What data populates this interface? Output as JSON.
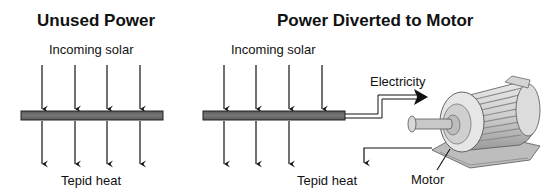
{
  "panels": {
    "left": {
      "title": "Unused Power",
      "incoming_label": "Incoming solar",
      "outgoing_label": "Tepid heat"
    },
    "right": {
      "title": "Power Diverted to Motor",
      "incoming_label": "Incoming solar",
      "outgoing_label": "Tepid heat",
      "electricity_label": "Electricity",
      "motor_label": "Motor"
    }
  },
  "colors": {
    "panel_bar": "#6e6e6e",
    "arrow": "#111111",
    "background": "#ffffff"
  }
}
